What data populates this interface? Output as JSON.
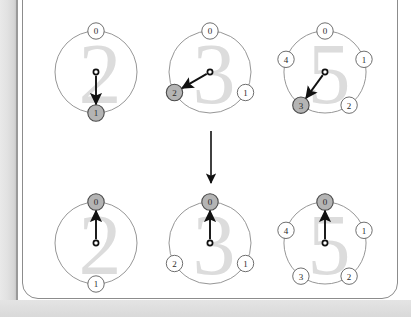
{
  "figure": {
    "colors": {
      "ring_stroke": "#8a8a8a",
      "node_fill": "#ffffff",
      "node_stroke": "#555555",
      "node_highlight_fill": "#b4b4b4",
      "arrow_color": "#111111",
      "watermark_color": "#dcdcdc",
      "frame_border": "#8c8c8c",
      "page_gutter": "#e2e2e2",
      "background": "#ffffff"
    },
    "transition_arrow": {
      "name": "downward-transition-arrow",
      "direction": "down",
      "x": 211,
      "y_start": 131,
      "y_end": 183
    },
    "rows": [
      {
        "row_name": "before-row",
        "rings": [
          {
            "name": "ring-mod-2-before",
            "watermark": "2",
            "cx": 96,
            "cy": 72,
            "r": 41,
            "pointer_target": 1,
            "highlighted_node": 1,
            "nodes": [
              {
                "label": "0",
                "angle": -90
              },
              {
                "label": "1",
                "angle": 90
              }
            ]
          },
          {
            "name": "ring-mod-3-before",
            "watermark": "3",
            "cx": 210,
            "cy": 72,
            "r": 41,
            "pointer_target": 2,
            "highlighted_node": 2,
            "nodes": [
              {
                "label": "0",
                "angle": -90
              },
              {
                "label": "1",
                "angle": 30
              },
              {
                "label": "2",
                "angle": 150
              }
            ]
          },
          {
            "name": "ring-mod-5-before",
            "watermark": "5",
            "cx": 325,
            "cy": 72,
            "r": 41,
            "pointer_target": 3,
            "highlighted_node": 3,
            "nodes": [
              {
                "label": "0",
                "angle": -90
              },
              {
                "label": "1",
                "angle": -18
              },
              {
                "label": "2",
                "angle": 54
              },
              {
                "label": "3",
                "angle": 126
              },
              {
                "label": "4",
                "angle": 198
              }
            ]
          }
        ]
      },
      {
        "row_name": "after-row",
        "rings": [
          {
            "name": "ring-mod-2-after",
            "watermark": "2",
            "cx": 96,
            "cy": 243,
            "r": 41,
            "pointer_target": 0,
            "highlighted_node": 0,
            "nodes": [
              {
                "label": "0",
                "angle": -90
              },
              {
                "label": "1",
                "angle": 90
              }
            ]
          },
          {
            "name": "ring-mod-3-after",
            "watermark": "3",
            "cx": 210,
            "cy": 243,
            "r": 41,
            "pointer_target": 0,
            "highlighted_node": 0,
            "nodes": [
              {
                "label": "0",
                "angle": -90
              },
              {
                "label": "1",
                "angle": 30
              },
              {
                "label": "2",
                "angle": 150
              }
            ]
          },
          {
            "name": "ring-mod-5-after",
            "watermark": "5",
            "cx": 325,
            "cy": 243,
            "r": 41,
            "pointer_target": 0,
            "highlighted_node": 0,
            "nodes": [
              {
                "label": "0",
                "angle": -90
              },
              {
                "label": "1",
                "angle": -18
              },
              {
                "label": "2",
                "angle": 54
              },
              {
                "label": "3",
                "angle": 126
              },
              {
                "label": "4",
                "angle": 198
              }
            ]
          }
        ]
      }
    ]
  }
}
